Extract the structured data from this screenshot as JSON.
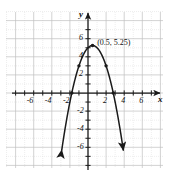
{
  "figure": {
    "background_color": "#ffffff",
    "grid_color_minor": "#dcdcdc",
    "grid_color_major": "#c0c0c0",
    "axis_color": "#1a1a1a",
    "curve_color": "#1a1a1a",
    "grid_rect": {
      "x": 6,
      "y": 12,
      "w": 157,
      "h": 156
    }
  },
  "chart_data": {
    "type": "line",
    "title": "",
    "xlabel": "x",
    "ylabel": "y",
    "grid": true,
    "legend": "none",
    "xlim": [
      -7.6,
      8.4
    ],
    "ylim": [
      -8.0,
      7.5
    ],
    "xticks": [
      -6,
      -4,
      -2,
      2,
      4,
      6
    ],
    "yticks": [
      6,
      4,
      2,
      -2,
      -4,
      -6
    ],
    "xtick_labels": [
      "-6",
      "-4",
      "-2",
      "2",
      "4",
      "6"
    ],
    "ytick_labels": [
      "6",
      "4",
      "2",
      "-2",
      "-4",
      "-6"
    ],
    "tick_step": 1,
    "major_step": 2,
    "series": [
      {
        "name": "parabola",
        "equation": "y = -(x - 0.5)^2 + 5.25",
        "vertex": [
          0.5,
          5.25
        ],
        "a": -1,
        "x_intercepts": [
          -1.79,
          2.79
        ],
        "y_intercept": 5.0,
        "x_start": -2.9,
        "x_end": 3.9,
        "arrow_start": true,
        "arrow_end": true
      }
    ],
    "annotations": [
      {
        "text": "(0.5, 5.25)",
        "x": 0.9,
        "y": 5.6,
        "target": [
          0.5,
          5.25
        ]
      }
    ],
    "marked_points": [
      {
        "x": 0.5,
        "y": 5.25
      },
      {
        "x": -1.0,
        "y": 3.0
      },
      {
        "x": -1.79,
        "y": 0.0
      },
      {
        "x": 2.0,
        "y": 3.0
      },
      {
        "x": 2.79,
        "y": 0.0
      }
    ]
  },
  "axis_labels": {
    "x_axis": "x",
    "y_axis": "y"
  }
}
